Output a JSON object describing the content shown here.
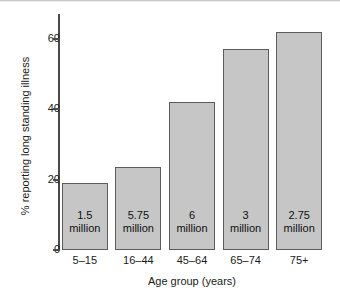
{
  "chart_data": {
    "type": "bar",
    "title": "",
    "xlabel": "Age group (years)",
    "ylabel": "% reporting long standing illness",
    "categories": [
      "5–15",
      "16–44",
      "45–64",
      "65–74",
      "75+"
    ],
    "values": [
      19,
      23.5,
      42,
      57,
      62
    ],
    "bar_labels": [
      {
        "number": "1.5",
        "unit": "million"
      },
      {
        "number": "5.75",
        "unit": "million"
      },
      {
        "number": "6",
        "unit": "million"
      },
      {
        "number": "3",
        "unit": "million"
      },
      {
        "number": "2.75",
        "unit": "million"
      }
    ],
    "ylim": [
      0,
      67
    ],
    "yticks": [
      "0",
      "20",
      "40",
      "60"
    ],
    "ytick_values": [
      0,
      20,
      40,
      60
    ],
    "grid": false,
    "legend": "none",
    "colors": {
      "bar_fill": "#c6c6c6",
      "bar_edge": "#5c5c5c",
      "axis": "#4a4a4a",
      "text": "#1a1a1a",
      "background": "#ffffff"
    }
  }
}
